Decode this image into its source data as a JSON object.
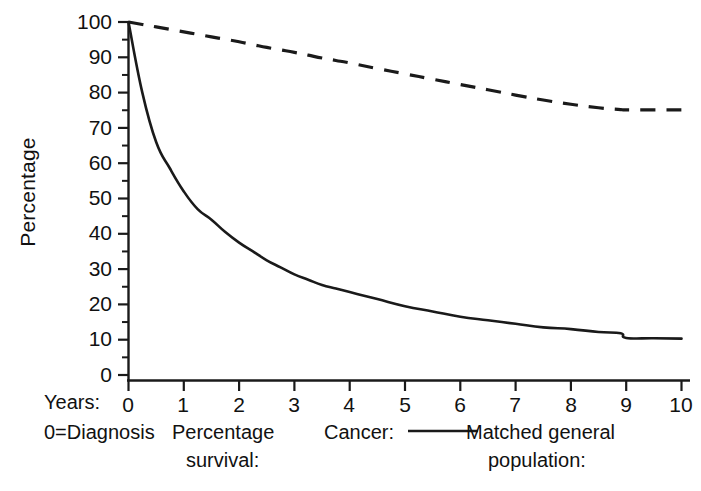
{
  "chart_data": {
    "type": "line",
    "title": "",
    "xlabel": "Years: 0 = Diagnosis",
    "ylabel": "Percentage",
    "xlim": [
      0,
      10
    ],
    "ylim": [
      0,
      100
    ],
    "grid": false,
    "legend_position": "below-axes",
    "x_ticks": [
      "0",
      "1",
      "2",
      "3",
      "4",
      "5",
      "6",
      "7",
      "8",
      "9",
      "10"
    ],
    "y_ticks": [
      "0",
      "10",
      "20",
      "30",
      "40",
      "50",
      "60",
      "70",
      "80",
      "90",
      "100"
    ],
    "y_minor_tick_step": 5,
    "x": [
      0,
      0.25,
      0.5,
      0.75,
      1,
      1.25,
      1.5,
      1.75,
      2,
      2.25,
      2.5,
      2.75,
      3,
      3.25,
      3.5,
      3.75,
      4,
      4.5,
      5,
      5.5,
      6,
      6.5,
      7,
      7.5,
      8,
      8.5,
      8.9,
      9,
      9.5,
      10
    ],
    "series": [
      {
        "name": "Cancer",
        "style": "solid",
        "color": "#1a1a1a",
        "values": [
          100,
          80,
          66,
          58.5,
          52,
          47,
          44,
          40.5,
          37.5,
          35,
          32.5,
          30.5,
          28.5,
          27,
          25.5,
          24.5,
          23.5,
          21.5,
          19.5,
          18,
          16.5,
          15.5,
          14.5,
          13.5,
          13,
          12.2,
          11.8,
          10.5,
          10.4,
          10.3
        ]
      },
      {
        "name": "Matched general population",
        "style": "dashed",
        "color": "#1a1a1a",
        "values": [
          100,
          99.3,
          98.6,
          97.9,
          97.2,
          96.5,
          95.8,
          95.1,
          94.4,
          93.6,
          92.8,
          92.1,
          91.4,
          90.6,
          89.8,
          89.1,
          88.4,
          86.8,
          85.3,
          83.8,
          82.3,
          80.8,
          79.3,
          77.9,
          76.7,
          75.7,
          75.2,
          75.1,
          75.1,
          75.1
        ]
      }
    ]
  },
  "axes": {
    "y_axis_label": "Percentage",
    "y_tick_labels": [
      "100",
      "90",
      "80",
      "70",
      "60",
      "50",
      "40",
      "30",
      "20",
      "10",
      "0"
    ],
    "x_tick_labels": [
      "0",
      "1",
      "2",
      "3",
      "4",
      "5",
      "6",
      "7",
      "8",
      "9",
      "10"
    ]
  },
  "captions": {
    "years_label": "Years:",
    "diagnosis_label": "0=Diagnosis",
    "percentage_survival_line1": "Percentage",
    "percentage_survival_line2": "survival:",
    "cancer_label": "Cancer:",
    "matched_line1": "Matched general",
    "matched_line2": "population:"
  }
}
